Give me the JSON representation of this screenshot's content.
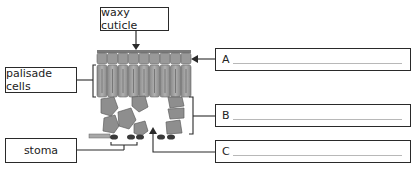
{
  "labels": {
    "waxy_cuticle": "waxy cuticle",
    "palisade_cells": "palisade cells",
    "stoma": "stoma"
  },
  "answer_boxes": [
    {
      "letter": "A",
      "value": ""
    },
    {
      "letter": "B",
      "value": ""
    },
    {
      "letter": "C",
      "value": ""
    }
  ],
  "colors": {
    "cell_fill": "#9a9a9a",
    "cell_dark": "#6e6e6e",
    "guard_cell": "#3a3a3a",
    "line": "#2a2a2a"
  }
}
